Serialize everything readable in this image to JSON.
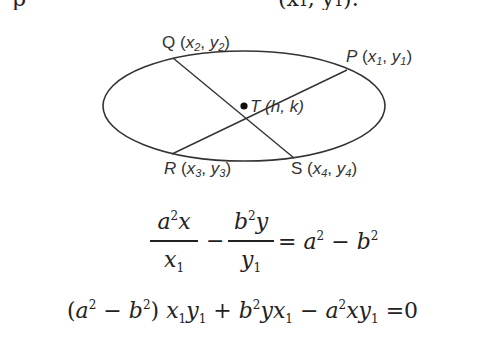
{
  "clipped_top_line": {
    "prefix": "p",
    "suffix": "(x₁, y₁)."
  },
  "figure": {
    "ellipse": {
      "cx": 244,
      "cy": 106,
      "rx": 141,
      "ry": 55,
      "stroke": "#333333"
    },
    "center_point": {
      "name": "T",
      "coords": "(h, k)",
      "x": 244,
      "y": 106
    },
    "points": [
      {
        "name": "Q",
        "x_sym": "x",
        "x_sub": "2",
        "y_sym": "y",
        "y_sub": "2",
        "x": 173,
        "y": 58
      },
      {
        "name": "P",
        "x_sym": "x",
        "x_sub": "1",
        "y_sym": "y",
        "y_sub": "1",
        "x": 347,
        "y": 70
      },
      {
        "name": "R",
        "x_sym": "x",
        "x_sub": "3",
        "y_sym": "y",
        "y_sub": "3",
        "x": 172,
        "y": 154
      },
      {
        "name": "S",
        "x_sym": "x",
        "x_sub": "4",
        "y_sym": "y",
        "y_sub": "4",
        "x": 294,
        "y": 158
      }
    ],
    "labels": {
      "Q": {
        "letter": "Q",
        "open": " (",
        "x": "x",
        "x_sub": "2",
        "comma": ", ",
        "y": "y",
        "y_sub": "2",
        "close": ")"
      },
      "P": {
        "letter": "P",
        "open": " (",
        "x": "x",
        "x_sub": "1",
        "comma": ", ",
        "y": "y",
        "y_sub": "1",
        "close": ")"
      },
      "T": {
        "letter": "T",
        "text": " (h, k)"
      },
      "R": {
        "letter": "R",
        "open": " (",
        "x": "x",
        "x_sub": "3",
        "comma": ", ",
        "y": "y",
        "y_sub": "3",
        "close": ")"
      },
      "S": {
        "letter": "S",
        "open": " (",
        "x": "x",
        "x_sub": "4",
        "comma": ", ",
        "y": "y",
        "y_sub": "4",
        "close": ")"
      }
    }
  },
  "equation1": {
    "frac1": {
      "num_base": "a",
      "num_exp": "2",
      "num_var": "x",
      "den_var": "x",
      "den_sub": "1"
    },
    "minus": "−",
    "frac2": {
      "num_base": "b",
      "num_exp": "2",
      "num_var": "y",
      "den_var": "y",
      "den_sub": "1"
    },
    "rhs": {
      "eq": "=",
      "a": "a",
      "a_exp": "2",
      "minus": "−",
      "b": "b",
      "b_exp": "2"
    }
  },
  "equation2": {
    "open": "(",
    "a": "a",
    "a_exp": "2",
    "minus1": "−",
    "b": "b",
    "b_exp": "2",
    "close": ")",
    "t1_x": "x",
    "t1_x_sub": "1",
    "t1_y": "y",
    "t1_y_sub": "1",
    "plus": "+",
    "t2_b": "b",
    "t2_b_exp": "2",
    "t2_y": "y",
    "t2_x": "x",
    "t2_x_sub": "1",
    "minus2": "−",
    "t3_a": "a",
    "t3_a_exp": "2",
    "t3_x": "x",
    "t3_y": "y",
    "t3_y_sub": "1",
    "eq": "=",
    "zero": "0"
  }
}
